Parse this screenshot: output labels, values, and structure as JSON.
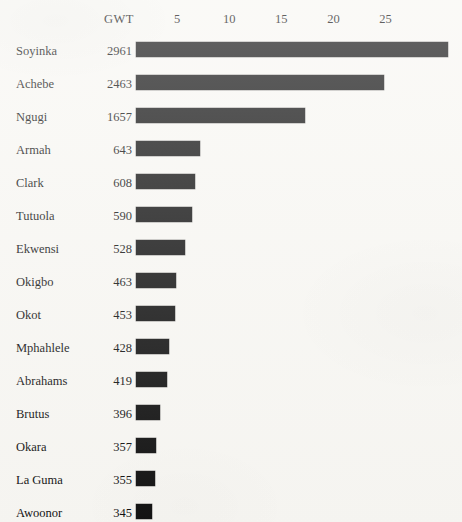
{
  "chart_data": {
    "type": "bar",
    "orientation": "horizontal",
    "title": "",
    "subtitle": "",
    "xlabel": "",
    "ylabel": "",
    "value_column_header": "GWT",
    "grid": false,
    "legend": false,
    "axis_position": "top",
    "xlim": [
      0,
      31
    ],
    "xticks": [
      5,
      10,
      15,
      20,
      25
    ],
    "xtick_labels": [
      "5",
      "10",
      "15",
      "20",
      "25"
    ],
    "categories": [
      "Soyinka",
      "Achebe",
      "Ngugi",
      "Armah",
      "Clark",
      "Tutuola",
      "Ekwensi",
      "Okigbo",
      "Okot",
      "Mphahlele",
      "Abrahams",
      "Brutus",
      "Okara",
      "La Guma",
      "Awoonor"
    ],
    "gwt_values": [
      "2961",
      "2463",
      "1657",
      "643",
      "608",
      "590",
      "528",
      "463",
      "453",
      "428",
      "419",
      "396",
      "357",
      "355",
      "345"
    ],
    "values": [
      31.0,
      24.9,
      17.3,
      7.2,
      6.7,
      6.4,
      5.8,
      4.9,
      4.8,
      4.2,
      4.0,
      3.4,
      3.0,
      2.9,
      2.6
    ],
    "bar_color": "#131313",
    "background_color": "#f8f7f3",
    "rows": [
      {
        "name": "Soyinka",
        "gwt": "2961",
        "value": 31.0
      },
      {
        "name": "Achebe",
        "gwt": "2463",
        "value": 24.9
      },
      {
        "name": "Ngugi",
        "gwt": "1657",
        "value": 17.3
      },
      {
        "name": "Armah",
        "gwt": "643",
        "value": 7.2
      },
      {
        "name": "Clark",
        "gwt": "608",
        "value": 6.7
      },
      {
        "name": "Tutuola",
        "gwt": "590",
        "value": 6.4
      },
      {
        "name": "Ekwensi",
        "gwt": "528",
        "value": 5.8
      },
      {
        "name": "Okigbo",
        "gwt": "463",
        "value": 4.9
      },
      {
        "name": "Okot",
        "gwt": "453",
        "value": 4.8
      },
      {
        "name": "Mphahlele",
        "gwt": "428",
        "value": 4.2
      },
      {
        "name": "Abrahams",
        "gwt": "419",
        "value": 4.0
      },
      {
        "name": "Brutus",
        "gwt": "396",
        "value": 3.4
      },
      {
        "name": "Okara",
        "gwt": "357",
        "value": 3.0
      },
      {
        "name": "La Guma",
        "gwt": "355",
        "value": 2.9
      },
      {
        "name": "Awoonor",
        "gwt": "345",
        "value": 2.6
      }
    ]
  }
}
